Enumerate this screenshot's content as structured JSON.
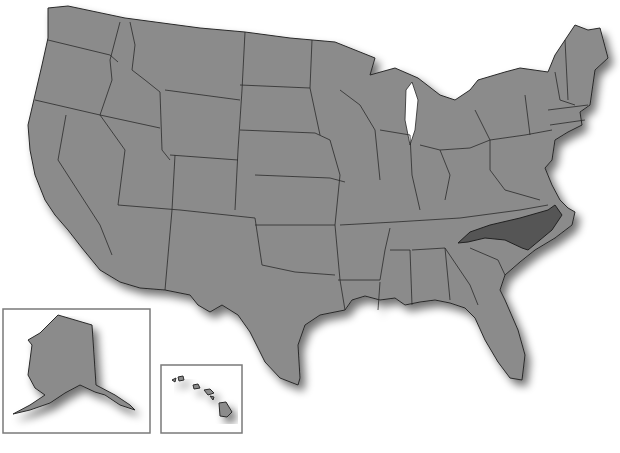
{
  "map": {
    "title": "",
    "region": "United States",
    "highlighted_state": "North Carolina",
    "colors": {
      "land": "#8b8b8b",
      "highlight": "#555555",
      "border": "#2a2a2a",
      "background": "#ffffff",
      "inset_frame": "#7a7a7a"
    },
    "insets": [
      {
        "label": "Alaska",
        "box": [
          3,
          309,
          147,
          124
        ]
      },
      {
        "label": "Hawaii",
        "box": [
          161,
          365,
          81,
          68
        ]
      }
    ]
  }
}
